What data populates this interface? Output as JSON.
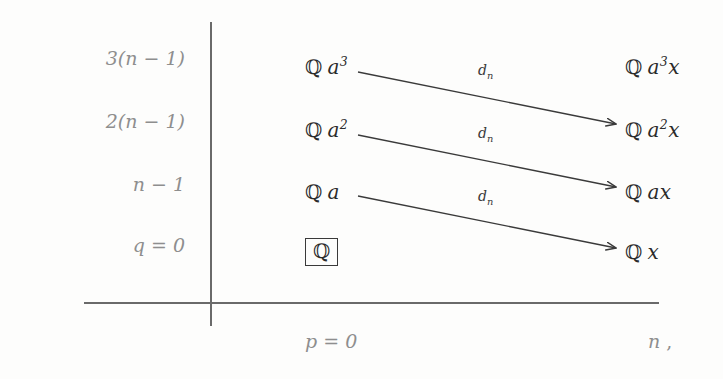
{
  "diagram": {
    "kind": "spectral-sequence-E-page",
    "background_color": "#fdfdfc",
    "axis_color": "#6a6a6a",
    "label_color": "#8e8e8e",
    "entry_color": "#2b2b2b",
    "trailing_punctuation": ","
  },
  "axes": {
    "vertical_label_top": "q",
    "horizontal_label": "p"
  },
  "q_labels": [
    {
      "id": "q-row-3",
      "text": "3(n − 1)",
      "value": "3(n-1)"
    },
    {
      "id": "q-row-2",
      "text": "2(n − 1)",
      "value": "2(n-1)"
    },
    {
      "id": "q-row-1",
      "text": "n − 1",
      "value": "n-1"
    },
    {
      "id": "q-row-0",
      "text": "q = 0",
      "value": "0"
    }
  ],
  "p_labels": [
    {
      "id": "p-col-0",
      "text": "p = 0",
      "value": "0"
    },
    {
      "id": "p-col-n",
      "text": "n",
      "value": "n"
    }
  ],
  "entries": {
    "col0": [
      {
        "id": "entry-q-a3",
        "ring": "ℚ",
        "gen": "a",
        "exp": "3",
        "boxed": false
      },
      {
        "id": "entry-q-a2",
        "ring": "ℚ",
        "gen": "a",
        "exp": "2",
        "boxed": false
      },
      {
        "id": "entry-q-a",
        "ring": "ℚ",
        "gen": "a",
        "exp": "",
        "boxed": false
      },
      {
        "id": "entry-q",
        "ring": "ℚ",
        "gen": "",
        "exp": "",
        "boxed": true
      }
    ],
    "coln": [
      {
        "id": "entry-q-a3x",
        "ring": "ℚ",
        "gen": "a",
        "exp": "3",
        "tail": "x"
      },
      {
        "id": "entry-q-a2x",
        "ring": "ℚ",
        "gen": "a",
        "exp": "2",
        "tail": "x"
      },
      {
        "id": "entry-q-ax",
        "ring": "ℚ",
        "gen": "a",
        "exp": "",
        "tail": "x"
      },
      {
        "id": "entry-q-x",
        "ring": "ℚ",
        "gen": "",
        "exp": "",
        "tail": "x"
      }
    ]
  },
  "differentials": [
    {
      "id": "d-1",
      "label": "d",
      "sub": "n",
      "from": "entry-q-a3",
      "to": "entry-q-a2x"
    },
    {
      "id": "d-2",
      "label": "d",
      "sub": "n",
      "from": "entry-q-a2",
      "to": "entry-q-ax"
    },
    {
      "id": "d-3",
      "label": "d",
      "sub": "n",
      "from": "entry-q-a",
      "to": "entry-q-x"
    }
  ]
}
